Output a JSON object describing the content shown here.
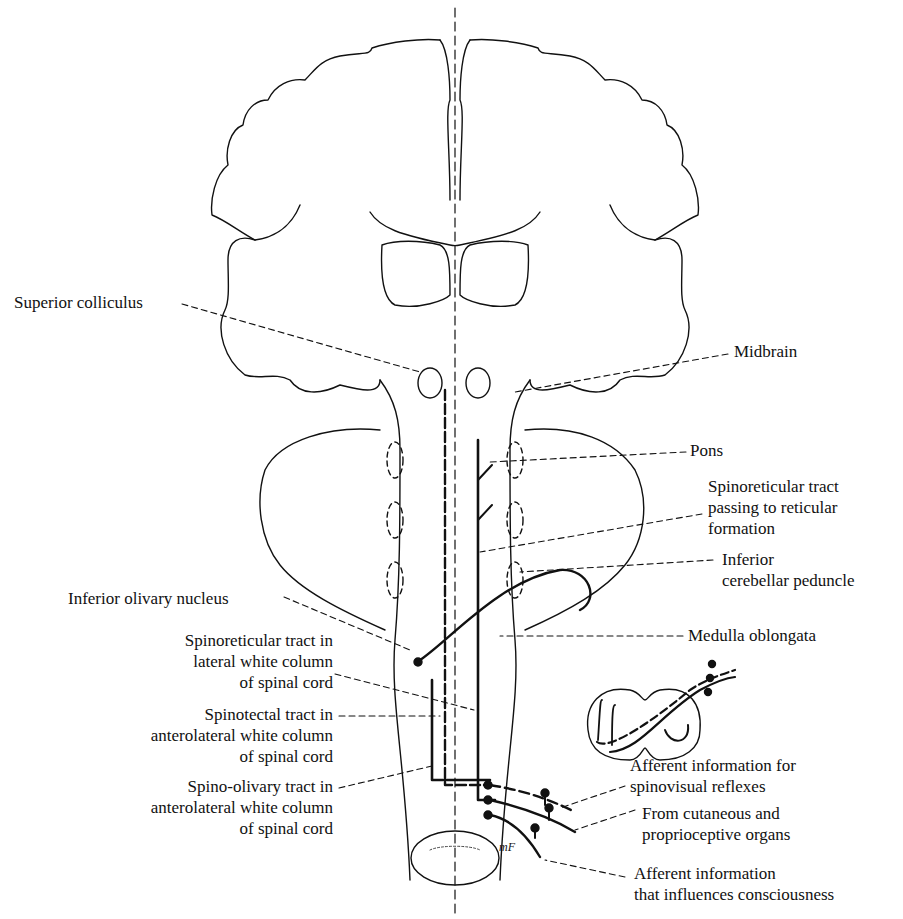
{
  "figure": {
    "type": "anatomical line drawing",
    "colors": {
      "ink": "#111111",
      "background": "#ffffff"
    }
  },
  "labels": {
    "superior_colliculus": "Superior colliculus",
    "midbrain": "Midbrain",
    "pons": "Pons",
    "spinoreticular_passing": [
      "Spinoreticular tract",
      "passing to reticular",
      "formation"
    ],
    "inferior_cerebellar_peduncle": [
      "Inferior",
      "cerebellar peduncle"
    ],
    "inferior_olivary_nucleus": "Inferior olivary nucleus",
    "spinoreticular_lateral": [
      "Spinoreticular tract in",
      "lateral white column",
      "of spinal cord"
    ],
    "medulla_oblongata": "Medulla oblongata",
    "spinotectal": [
      "Spinotectal tract in",
      "anterolateral white column",
      "of spinal cord"
    ],
    "spino_olivary": [
      "Spino-olivary tract in",
      "anterolateral white column",
      "of spinal cord"
    ],
    "afferent_spinovisual": [
      "Afferent information for",
      "spinovisual reflexes"
    ],
    "cutaneous": [
      "From cutaneous and",
      "proprioceptive organs"
    ],
    "afferent_consciousness": [
      "Afferent information",
      "that influences consciousness"
    ],
    "mf": "mF"
  }
}
